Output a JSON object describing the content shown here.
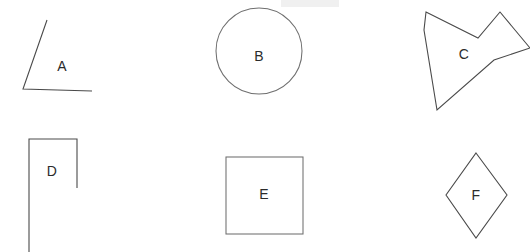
{
  "document": {
    "title": "Geometric Shapes Worksheet",
    "background_color": "#ffffff",
    "width": 530,
    "height": 252,
    "stroke_color": "#4a4a4a",
    "label_color": "#2b2b2b",
    "faint_band_color": "#f0f0f0"
  },
  "shapes": [
    {
      "id": "shape-a",
      "label": "A",
      "name": "angle",
      "label_x": 62,
      "label_y": 67,
      "geometry_type": "polyline",
      "points": "47,20 23,89 92,91",
      "row": 1,
      "column": 1
    },
    {
      "id": "shape-b",
      "label": "B",
      "name": "circle",
      "label_x": 259,
      "label_y": 57,
      "geometry_type": "circle",
      "cx": 259,
      "cy": 51,
      "r": 43,
      "row": 1,
      "column": 2
    },
    {
      "id": "shape-c",
      "label": "C",
      "name": "concave-star-polygon",
      "label_x": 464,
      "label_y": 55,
      "geometry_type": "polygon",
      "points": "426,12 478,38 500,12 530,48 494,60 437,110 424,30",
      "row": 1,
      "column": 3
    },
    {
      "id": "shape-d",
      "label": "D",
      "name": "open-rectangle",
      "label_x": 52,
      "label_y": 172,
      "geometry_type": "polyline",
      "points": "77,188 77,139 29,139 29,252",
      "row": 2,
      "column": 1
    },
    {
      "id": "shape-e",
      "label": "E",
      "name": "square",
      "label_x": 264,
      "label_y": 195,
      "geometry_type": "rect",
      "x": 226,
      "y": 157,
      "width": 77,
      "height": 77,
      "row": 2,
      "column": 2
    },
    {
      "id": "shape-f",
      "label": "F",
      "name": "rhombus",
      "label_x": 476,
      "label_y": 196,
      "geometry_type": "polygon",
      "points": "476,153 507,195 476,238 446,195",
      "row": 2,
      "column": 3
    }
  ],
  "artifacts": [
    {
      "id": "faint-band-top",
      "name": "faint-gray-band",
      "x": 281,
      "y": 0,
      "width": 58,
      "height": 7
    }
  ]
}
